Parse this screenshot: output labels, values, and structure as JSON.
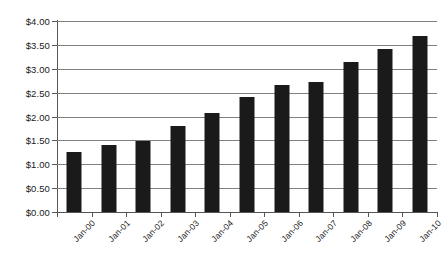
{
  "chart_data": {
    "type": "bar",
    "title": "",
    "subtitle": "",
    "xlabel": "",
    "ylabel": "",
    "categories": [
      "Jan-00",
      "Jan-01",
      "Jan-02",
      "Jan-03",
      "Jan-04",
      "Jan-05",
      "Jan-06",
      "Jan-07",
      "Jan-08",
      "Jan-09",
      "Jan-10"
    ],
    "values": [
      1.25,
      1.4,
      1.48,
      1.81,
      2.07,
      2.41,
      2.66,
      2.72,
      3.14,
      3.41,
      3.68
    ],
    "ylim": [
      0,
      4
    ],
    "ytick_values": [
      0,
      0.5,
      1,
      1.5,
      2,
      2.5,
      3,
      3.5,
      4
    ],
    "ytick_labels": [
      "$0.00",
      "$0.50",
      "$1.00",
      "$1.50",
      "$2.00",
      "$2.50",
      "$3.00",
      "$3.50",
      "$4.00"
    ],
    "grid": true,
    "legend": false,
    "legend_position": "none",
    "bar_color": "#1a1a1a",
    "gridline_color": "#808080",
    "axis_color": "#555555",
    "background_color": "#ffffff",
    "xlabel_rotation": -45
  }
}
